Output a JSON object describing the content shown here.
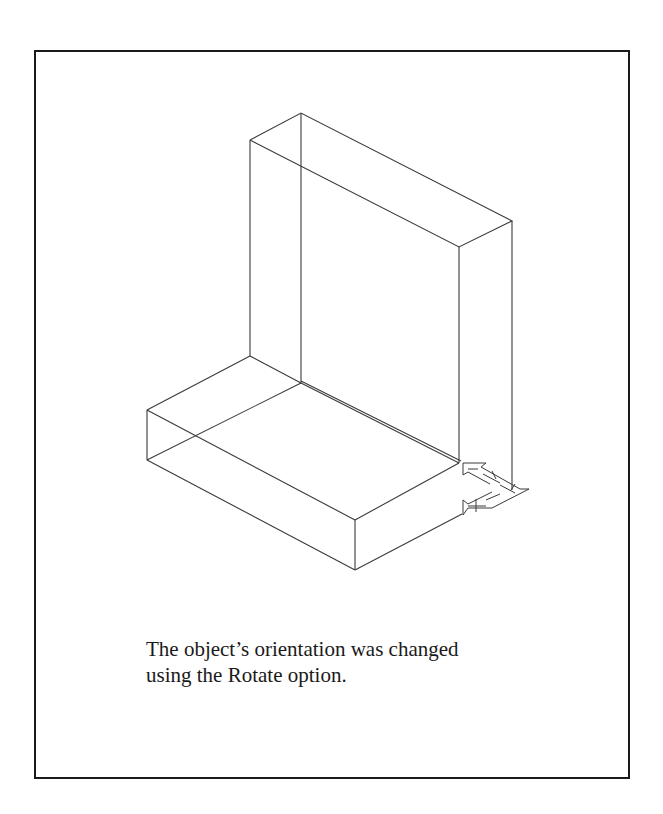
{
  "figure": {
    "caption_lines": [
      "The object’s orientation was changed",
      "using the Rotate option."
    ],
    "line_color": "#3a3a3a",
    "border_color": "#1a1a1a"
  }
}
